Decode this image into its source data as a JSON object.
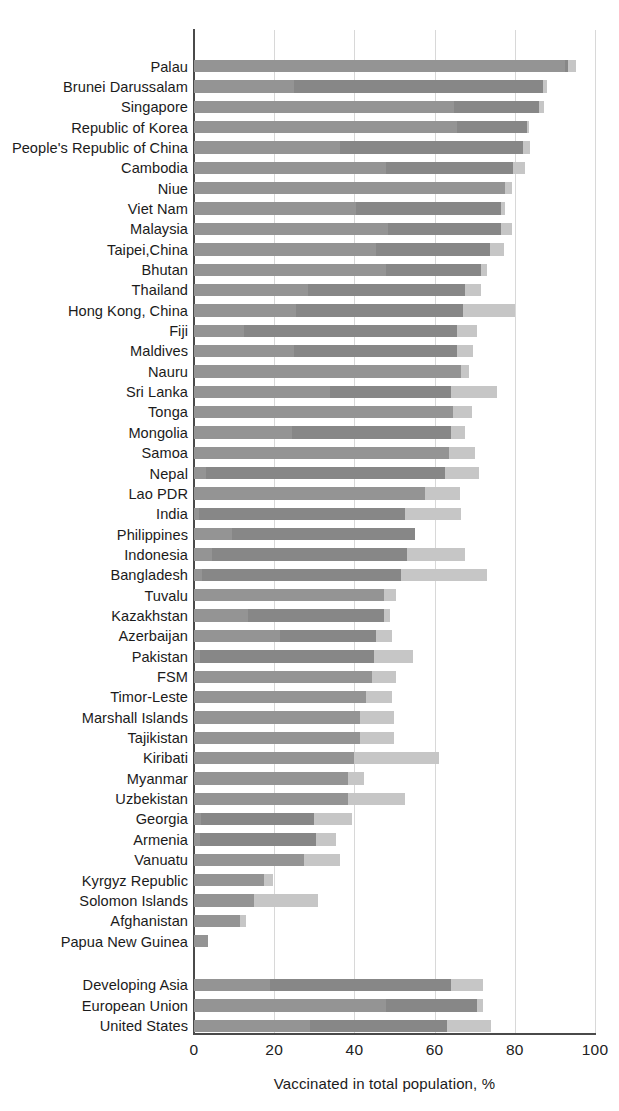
{
  "chart_data": {
    "type": "bar",
    "orientation": "horizontal",
    "stacked": true,
    "title": "",
    "xlabel": "Vaccinated in total population, %",
    "ylabel": "",
    "xlim": [
      0,
      100
    ],
    "xticks": [
      "0",
      "20",
      "40",
      "60",
      "80",
      "100"
    ],
    "xtick_values": [
      0,
      20,
      40,
      60,
      80,
      100
    ],
    "grid": "vertical",
    "legend": "none",
    "series": [
      {
        "name": "segment-1",
        "color": "#949494"
      },
      {
        "name": "segment-2",
        "color": "#878787"
      },
      {
        "name": "segment-3",
        "color": "#c6c6c6"
      }
    ],
    "categories": [
      "Palau",
      "Brunei Darussalam",
      "Singapore",
      "Republic of Korea",
      "People's Republic of China",
      "Cambodia",
      "Niue",
      "Viet Nam",
      "Malaysia",
      "Taipei,China",
      "Bhutan",
      "Thailand",
      "Hong Kong, China",
      "Fiji",
      "Maldives",
      "Nauru",
      "Sri Lanka",
      "Tonga",
      "Mongolia",
      "Samoa",
      "Nepal",
      "Lao PDR",
      "India",
      "Philippines",
      "Indonesia",
      "Bangladesh",
      "Tuvalu",
      "Kazakhstan",
      "Azerbaijan",
      "Pakistan",
      "FSM",
      "Timor-Leste",
      "Marshall Islands",
      "Tajikistan",
      "Kiribati",
      "Myanmar",
      "Uzbekistan",
      "Georgia",
      "Armenia",
      "Vanuatu",
      "Kyrgyz Republic",
      "Solomon Islands",
      "Afghanistan",
      "Papua New Guinea",
      "Developing Asia",
      "European Union",
      "United States"
    ],
    "rows": [
      {
        "label": "Palau",
        "group": "country",
        "s1": 92.5,
        "s2": 0.8,
        "s3": 2.0,
        "total": 95.3
      },
      {
        "label": "Brunei Darussalam",
        "group": "country",
        "s1": 25.0,
        "s2": 62.0,
        "s3": 1.0,
        "total": 88.0
      },
      {
        "label": "Singapore",
        "group": "country",
        "s1": 64.8,
        "s2": 21.3,
        "s3": 1.1,
        "total": 87.2
      },
      {
        "label": "Republic of Korea",
        "group": "country",
        "s1": 65.5,
        "s2": 17.5,
        "s3": 0.6,
        "total": 83.6
      },
      {
        "label": "People's Republic of China",
        "group": "country",
        "s1": 36.5,
        "s2": 45.5,
        "s3": 1.8,
        "total": 83.8
      },
      {
        "label": "Cambodia",
        "group": "country",
        "s1": 48.0,
        "s2": 31.5,
        "s3": 3.0,
        "total": 82.5
      },
      {
        "label": "Niue",
        "group": "country",
        "s1": 77.5,
        "s2": 0.0,
        "s3": 1.8,
        "total": 79.3
      },
      {
        "label": "Viet Nam",
        "group": "country",
        "s1": 40.5,
        "s2": 36.0,
        "s3": 1.0,
        "total": 77.5
      },
      {
        "label": "Malaysia",
        "group": "country",
        "s1": 48.5,
        "s2": 28.0,
        "s3": 2.8,
        "total": 79.3
      },
      {
        "label": "Taipei,China",
        "group": "country",
        "s1": 45.5,
        "s2": 28.3,
        "s3": 3.5,
        "total": 77.3
      },
      {
        "label": "Bhutan",
        "group": "country",
        "s1": 48.0,
        "s2": 23.5,
        "s3": 1.5,
        "total": 73.0
      },
      {
        "label": "Thailand",
        "group": "country",
        "s1": 28.5,
        "s2": 39.0,
        "s3": 4.0,
        "total": 71.5
      },
      {
        "label": "Hong Kong, China",
        "group": "country",
        "s1": 25.5,
        "s2": 41.5,
        "s3": 13.0,
        "total": 80.0
      },
      {
        "label": "Fiji",
        "group": "country",
        "s1": 12.5,
        "s2": 53.0,
        "s3": 5.0,
        "total": 70.5
      },
      {
        "label": "Maldives",
        "group": "country",
        "s1": 25.0,
        "s2": 40.5,
        "s3": 4.0,
        "total": 69.5
      },
      {
        "label": "Nauru",
        "group": "country",
        "s1": 66.5,
        "s2": 0.0,
        "s3": 2.0,
        "total": 68.5
      },
      {
        "label": "Sri Lanka",
        "group": "country",
        "s1": 34.0,
        "s2": 30.0,
        "s3": 11.5,
        "total": 75.5
      },
      {
        "label": "Tonga",
        "group": "country",
        "s1": 64.5,
        "s2": 0.0,
        "s3": 4.8,
        "total": 69.3
      },
      {
        "label": "Mongolia",
        "group": "country",
        "s1": 24.5,
        "s2": 39.5,
        "s3": 3.5,
        "total": 67.5
      },
      {
        "label": "Samoa",
        "group": "country",
        "s1": 63.5,
        "s2": 0.0,
        "s3": 6.5,
        "total": 70.0
      },
      {
        "label": "Nepal",
        "group": "country",
        "s1": 3.0,
        "s2": 59.5,
        "s3": 8.5,
        "total": 71.0
      },
      {
        "label": "Lao PDR",
        "group": "country",
        "s1": 57.5,
        "s2": 0.0,
        "s3": 8.8,
        "total": 66.3
      },
      {
        "label": "India",
        "group": "country",
        "s1": 1.2,
        "s2": 51.3,
        "s3": 14.0,
        "total": 66.5
      },
      {
        "label": "Philippines",
        "group": "country",
        "s1": 9.5,
        "s2": 45.5,
        "s3": 0.0,
        "total": 55.0
      },
      {
        "label": "Indonesia",
        "group": "country",
        "s1": 4.5,
        "s2": 48.5,
        "s3": 14.5,
        "total": 67.5
      },
      {
        "label": "Bangladesh",
        "group": "country",
        "s1": 2.0,
        "s2": 49.5,
        "s3": 21.5,
        "total": 73.0
      },
      {
        "label": "Tuvalu",
        "group": "country",
        "s1": 47.5,
        "s2": 0.0,
        "s3": 3.0,
        "total": 50.5
      },
      {
        "label": "Kazakhstan",
        "group": "country",
        "s1": 13.5,
        "s2": 34.0,
        "s3": 1.5,
        "total": 49.0
      },
      {
        "label": "Azerbaijan",
        "group": "country",
        "s1": 21.5,
        "s2": 24.0,
        "s3": 4.0,
        "total": 49.5
      },
      {
        "label": "Pakistan",
        "group": "country",
        "s1": 1.5,
        "s2": 43.5,
        "s3": 9.5,
        "total": 54.5
      },
      {
        "label": "FSM",
        "group": "country",
        "s1": 44.5,
        "s2": 0.0,
        "s3": 6.0,
        "total": 50.5
      },
      {
        "label": "Timor-Leste",
        "group": "country",
        "s1": 43.0,
        "s2": 0.0,
        "s3": 6.5,
        "total": 49.5
      },
      {
        "label": "Marshall Islands",
        "group": "country",
        "s1": 41.5,
        "s2": 0.0,
        "s3": 8.5,
        "total": 50.0
      },
      {
        "label": "Tajikistan",
        "group": "country",
        "s1": 41.5,
        "s2": 0.0,
        "s3": 8.5,
        "total": 50.0
      },
      {
        "label": "Kiribati",
        "group": "country",
        "s1": 40.0,
        "s2": 0.0,
        "s3": 21.0,
        "total": 61.0
      },
      {
        "label": "Myanmar",
        "group": "country",
        "s1": 38.5,
        "s2": 0.0,
        "s3": 4.0,
        "total": 42.5
      },
      {
        "label": "Uzbekistan",
        "group": "country",
        "s1": 38.5,
        "s2": 0.0,
        "s3": 14.0,
        "total": 52.5
      },
      {
        "label": "Georgia",
        "group": "country",
        "s1": 1.8,
        "s2": 28.2,
        "s3": 9.5,
        "total": 39.5
      },
      {
        "label": "Armenia",
        "group": "country",
        "s1": 1.5,
        "s2": 29.0,
        "s3": 5.0,
        "total": 35.5
      },
      {
        "label": "Vanuatu",
        "group": "country",
        "s1": 27.5,
        "s2": 0.0,
        "s3": 9.0,
        "total": 36.5
      },
      {
        "label": "Kyrgyz Republic",
        "group": "country",
        "s1": 17.5,
        "s2": 0.0,
        "s3": 2.2,
        "total": 19.7
      },
      {
        "label": "Solomon Islands",
        "group": "country",
        "s1": 15.0,
        "s2": 0.0,
        "s3": 16.0,
        "total": 31.0
      },
      {
        "label": "Afghanistan",
        "group": "country",
        "s1": 11.5,
        "s2": 0.0,
        "s3": 1.5,
        "total": 13.0
      },
      {
        "label": "Papua New Guinea",
        "group": "country",
        "s1": 3.5,
        "s2": 0.0,
        "s3": 0.0,
        "total": 3.5
      },
      {
        "label": "Developing Asia",
        "group": "aggregate",
        "s1": 19.0,
        "s2": 45.0,
        "s3": 8.0,
        "total": 72.0
      },
      {
        "label": "European Union",
        "group": "aggregate",
        "s1": 48.0,
        "s2": 22.5,
        "s3": 1.5,
        "total": 72.0
      },
      {
        "label": "United States",
        "group": "aggregate",
        "s1": 29.0,
        "s2": 34.0,
        "s3": 11.0,
        "total": 74.0
      }
    ]
  },
  "axis": {
    "x_title": "Vaccinated in total population, %"
  }
}
